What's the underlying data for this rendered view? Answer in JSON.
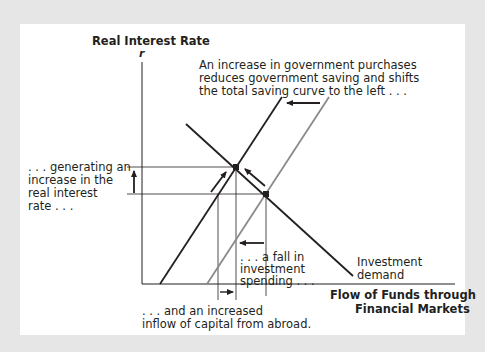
{
  "diagram": {
    "y_axis_label": "Real Interest Rate",
    "y_axis_symbol": "r",
    "x_axis_label_line1": "Flow of Funds through",
    "x_axis_label_line2": "Financial Markets",
    "annotations": {
      "top_line1": "An increase in government purchases",
      "top_line2": "reduces government saving and shifts",
      "top_line3": "the total saving curve to the left . . .",
      "left_line1": ". . . generating an",
      "left_line2": "increase in the",
      "left_line3": "real interest",
      "left_line4": "rate . . .",
      "mid_line1": ". . . a fall in",
      "mid_line2": "investment",
      "mid_line3": "spending . . .",
      "bottom_line1": ". . . and an increased",
      "bottom_line2": "inflow of capital from abroad.",
      "curve_line1": "Investment",
      "curve_line2": "demand"
    },
    "curves": [
      {
        "name": "Total saving (after increase in G)",
        "color": "#231f20",
        "from": [
          160,
          284
        ],
        "to": [
          282,
          97
        ]
      },
      {
        "name": "Total saving (original)",
        "color": "#8a8a8a",
        "from": [
          207,
          284
        ],
        "to": [
          329,
          97
        ]
      },
      {
        "name": "Investment demand",
        "color": "#231f20",
        "from": [
          186,
          124
        ],
        "to": [
          353,
          276
        ]
      }
    ],
    "equilibria": [
      {
        "name": "new",
        "x": 236,
        "y": 167
      },
      {
        "name": "original",
        "x": 266,
        "y": 194
      }
    ],
    "colors": {
      "background": "#e6e6e6",
      "panel": "#ffffff",
      "ink": "#231f20",
      "gray_curve": "#8a8a8a"
    }
  }
}
